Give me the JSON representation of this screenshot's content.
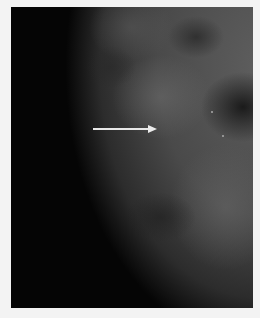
{
  "image": {
    "subject": "mammogram",
    "background_color": "#f3f3f3",
    "frame_color": "#050505",
    "annotation": {
      "type": "arrow",
      "direction": "right",
      "color": "#e8e8e8"
    }
  }
}
